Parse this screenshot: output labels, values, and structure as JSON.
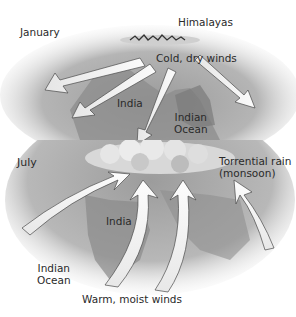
{
  "diagram": {
    "january": {
      "month_label": "January",
      "labels": {
        "mountains": "Himalayas",
        "winds": "Cold, dry winds",
        "land": "India",
        "ocean_line1": "Indian",
        "ocean_line2": "Ocean"
      }
    },
    "july": {
      "month_label": "July",
      "labels": {
        "rain_line1": "Torrential rain",
        "rain_line2": "(monsoon)",
        "land": "India",
        "ocean_line1": "Indian",
        "ocean_line2": "Ocean",
        "winds": "Warm, moist winds"
      }
    },
    "colors": {
      "background": "#ffffff",
      "land": "#8c8c8c",
      "sea_haze": "#c8c8c8",
      "arrow_fill": "#f2f2f2",
      "arrow_shadow": "#5a5a5a",
      "cloud": "#d9d9d9",
      "text": "#2a2a2a"
    }
  }
}
